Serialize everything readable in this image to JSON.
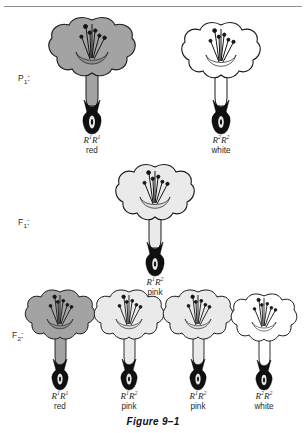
{
  "figure": {
    "caption": "Figure 9–1",
    "top_rule": true,
    "colors": {
      "red_fill": "#a3a3a3",
      "pink_fill": "#eaeaea",
      "white_fill": "#ffffff",
      "outline": "#1a1a1a",
      "ovary": "#101010",
      "rule": "#8e8e8e"
    }
  },
  "generations": [
    {
      "id": "p1",
      "label": "P",
      "label_sub": "1",
      "label_suffix": ":",
      "plants": [
        {
          "genotype_allele": "R",
          "sup_a": "1",
          "sup_b": "1",
          "phenotype": "red",
          "fill": "red"
        },
        {
          "genotype_allele": "R",
          "sup_a": "2",
          "sup_b": "2",
          "phenotype": "white",
          "fill": "white"
        }
      ]
    },
    {
      "id": "f1",
      "label": "F",
      "label_sub": "1",
      "label_suffix": ":",
      "plants": [
        {
          "genotype_allele": "R",
          "sup_a": "1",
          "sup_b": "2",
          "phenotype": "pink",
          "fill": "pink"
        }
      ]
    },
    {
      "id": "f2",
      "label": "F",
      "label_sub": "2",
      "label_suffix": ":",
      "plants": [
        {
          "genotype_allele": "R",
          "sup_a": "1",
          "sup_b": "1",
          "phenotype": "red",
          "fill": "red"
        },
        {
          "genotype_allele": "R",
          "sup_a": "1",
          "sup_b": "2",
          "phenotype": "pink",
          "fill": "pink"
        },
        {
          "genotype_allele": "R",
          "sup_a": "1",
          "sup_b": "2",
          "phenotype": "pink",
          "fill": "pink"
        },
        {
          "genotype_allele": "R",
          "sup_a": "2",
          "sup_b": "2",
          "phenotype": "white",
          "fill": "white"
        }
      ]
    }
  ]
}
